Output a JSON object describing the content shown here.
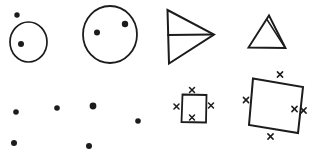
{
  "figure": {
    "width": 311,
    "height": 152,
    "background": "#ffffff",
    "ink": "#1c1c1c",
    "xmark_stroke_width": 1.5,
    "shapes": [
      {
        "name": "small-circle",
        "type": "ellipse",
        "cx": 28.5,
        "cy": 42,
        "rx": 18.5,
        "ry": 20,
        "w": 1.7
      },
      {
        "name": "small-circle-outside-dot",
        "type": "dot",
        "cx": 17,
        "cy": 15,
        "r": 2.7
      },
      {
        "name": "small-circle-inside-dot",
        "type": "dot",
        "cx": 21,
        "cy": 44,
        "r": 3.0
      },
      {
        "name": "large-circle",
        "type": "ellipse",
        "cx": 110,
        "cy": 34.5,
        "rx": 27,
        "ry": 28.5,
        "w": 1.8
      },
      {
        "name": "large-circle-dot-left",
        "type": "dot",
        "cx": 97,
        "cy": 32.5,
        "r": 3.0
      },
      {
        "name": "large-circle-dot-right",
        "type": "dot",
        "cx": 125,
        "cy": 24,
        "r": 3.2
      },
      {
        "name": "right-arrow-triangle",
        "type": "polygon",
        "points": [
          [
            167.5,
            10
          ],
          [
            214,
            34.5
          ],
          [
            169,
            63.5
          ]
        ],
        "w": 2.0
      },
      {
        "name": "right-arrow-triangle-midline",
        "type": "line",
        "x1": 168,
        "y1": 35,
        "x2": 213,
        "y2": 34.5,
        "w": 1.8
      },
      {
        "name": "small-triangle",
        "type": "polygon",
        "points": [
          [
            269,
            15.5
          ],
          [
            285.5,
            48
          ],
          [
            248.5,
            47.5
          ]
        ],
        "w": 1.9
      },
      {
        "name": "small-triangle-inner-line",
        "type": "line",
        "x1": 267,
        "y1": 19.5,
        "x2": 284,
        "y2": 46,
        "w": 1.5
      },
      {
        "name": "scatter-dot-1",
        "type": "dot",
        "cx": 16,
        "cy": 112,
        "r": 2.8
      },
      {
        "name": "scatter-dot-2",
        "type": "dot",
        "cx": 57,
        "cy": 108,
        "r": 2.8
      },
      {
        "name": "scatter-dot-3",
        "type": "dot",
        "cx": 93,
        "cy": 106,
        "r": 3.4
      },
      {
        "name": "scatter-dot-4",
        "type": "dot",
        "cx": 138,
        "cy": 121,
        "r": 2.8
      },
      {
        "name": "scatter-dot-5",
        "type": "dot",
        "cx": 14,
        "cy": 143,
        "r": 3.0
      },
      {
        "name": "scatter-dot-6",
        "type": "dot",
        "cx": 89,
        "cy": 146,
        "r": 3.0
      },
      {
        "name": "small-square",
        "type": "polygon",
        "points": [
          [
            182.5,
            94.5
          ],
          [
            206.5,
            95
          ],
          [
            206,
            122.5
          ],
          [
            181.5,
            122
          ]
        ],
        "w": 1.8
      },
      {
        "name": "small-square-x-top",
        "type": "xmark",
        "cx": 192,
        "cy": 90,
        "s": 2.5
      },
      {
        "name": "small-square-x-left",
        "type": "xmark",
        "cx": 176.5,
        "cy": 106.5,
        "s": 2.5
      },
      {
        "name": "small-square-x-right",
        "type": "xmark",
        "cx": 211,
        "cy": 105.5,
        "s": 2.5
      },
      {
        "name": "small-square-x-bottom",
        "type": "xmark",
        "cx": 192,
        "cy": 117.5,
        "s": 2.5
      },
      {
        "name": "large-square",
        "type": "polygon",
        "points": [
          [
            253,
            78.5
          ],
          [
            303,
            87
          ],
          [
            298,
            133
          ],
          [
            249,
            125
          ]
        ],
        "w": 2.0
      },
      {
        "name": "large-square-x-top",
        "type": "xmark",
        "cx": 280,
        "cy": 74.5,
        "s": 2.6
      },
      {
        "name": "large-square-x-left",
        "type": "xmark",
        "cx": 246,
        "cy": 100,
        "s": 2.6
      },
      {
        "name": "large-square-x-right-inner",
        "type": "xmark",
        "cx": 294.5,
        "cy": 109,
        "s": 2.6
      },
      {
        "name": "large-square-x-right-outer",
        "type": "xmark",
        "cx": 303.5,
        "cy": 110.5,
        "s": 2.6
      },
      {
        "name": "large-square-x-bottom",
        "type": "xmark",
        "cx": 270.5,
        "cy": 136.5,
        "s": 2.6
      }
    ]
  }
}
